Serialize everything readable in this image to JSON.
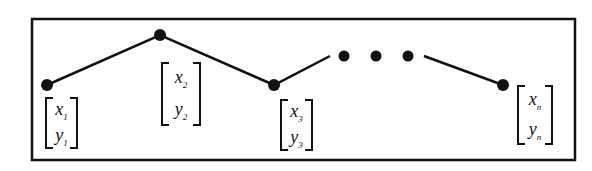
{
  "diagram": {
    "type": "polyline-with-nodes",
    "frame": {
      "x": 32,
      "y": 19,
      "w": 543,
      "h": 141,
      "stroke": "#111111"
    },
    "nodes": [
      {
        "id": "n1",
        "x": 47,
        "y": 85,
        "label_x": "x",
        "sub_x": "1",
        "label_y": "y",
        "sub_y": "1"
      },
      {
        "id": "n2",
        "x": 160,
        "y": 35,
        "label_x": "x",
        "sub_x": "2",
        "label_y": "y",
        "sub_y": "2"
      },
      {
        "id": "n3",
        "x": 274,
        "y": 85,
        "label_x": "x",
        "sub_x": "3",
        "label_y": "y",
        "sub_y": "3"
      },
      {
        "id": "nn",
        "x": 503,
        "y": 85,
        "label_x": "x",
        "sub_x": "n",
        "label_y": "y",
        "sub_y": "n"
      }
    ],
    "ellipsis_dots": [
      {
        "x": 344,
        "y": 56
      },
      {
        "x": 376,
        "y": 56
      },
      {
        "x": 408,
        "y": 56
      }
    ],
    "color": "#111111"
  }
}
